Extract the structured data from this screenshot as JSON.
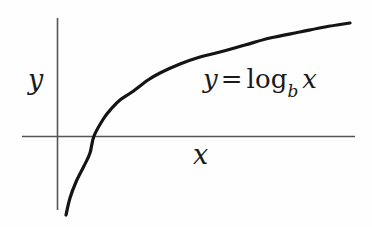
{
  "figure": {
    "background_color": "#fefefe",
    "axis_color": "#555555",
    "curve_color": "#141414"
  },
  "labels": {
    "y_axis": "y",
    "x_axis": "x",
    "equation": {
      "lhs": "y",
      "operator": "=",
      "function": "log",
      "base": "b",
      "argument": "x",
      "full_text": "y = log_b x"
    }
  },
  "chart_data": {
    "type": "line",
    "title": "",
    "subtitle": "",
    "xlabel": "x",
    "ylabel": "y",
    "annotations": [
      "y = log_b x"
    ],
    "legend": [],
    "legend_position": "none",
    "grid": false,
    "axis_style": "cartesian-crossing-axes",
    "xlim": [
      0,
      5.2
    ],
    "ylim": [
      -2.6,
      1.9
    ],
    "x_axis_pixel_y": 136,
    "y_axis_pixel_x": 57,
    "x_intercept": 1,
    "series": [
      {
        "name": "y = log_b x",
        "x": [
          0.13,
          0.2,
          0.3,
          0.45,
          0.62,
          0.8,
          1.0,
          1.25,
          1.55,
          1.9,
          2.3,
          2.8,
          3.4,
          4.1,
          4.6,
          5.1
        ],
        "y": [
          -2.45,
          -1.95,
          -1.48,
          -1.0,
          -0.62,
          -0.28,
          0.0,
          0.26,
          0.53,
          0.78,
          1.0,
          1.23,
          1.43,
          1.62,
          1.73,
          1.83
        ],
        "pixel_points": [
          [
            66,
            215
          ],
          [
            70,
            198
          ],
          [
            76,
            182
          ],
          [
            84,
            166
          ],
          [
            90,
            153
          ],
          [
            94,
            136
          ],
          [
            104,
            118
          ],
          [
            112,
            108
          ],
          [
            120,
            100
          ],
          [
            132,
            92
          ],
          [
            148,
            80
          ],
          [
            160,
            73
          ],
          [
            180,
            64
          ],
          [
            200,
            57
          ],
          [
            220,
            52
          ],
          [
            245,
            45
          ],
          [
            270,
            38
          ],
          [
            300,
            32
          ],
          [
            325,
            27
          ],
          [
            350,
            23
          ]
        ]
      }
    ]
  }
}
